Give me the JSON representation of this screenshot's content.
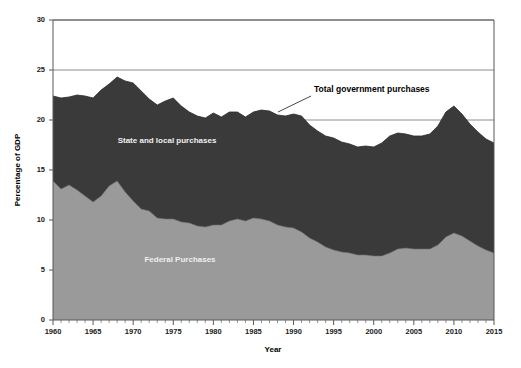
{
  "chart_data": {
    "type": "area",
    "stacked": true,
    "title": "",
    "xlabel": "Year",
    "ylabel": "Percentage of GDP",
    "xlim": [
      1960,
      2015
    ],
    "ylim": [
      0,
      30
    ],
    "ytick_values": [
      0,
      5,
      10,
      15,
      20,
      25,
      30
    ],
    "ytick_labels": [
      "0",
      "5",
      "10",
      "15",
      "20",
      "25",
      "30"
    ],
    "xtick_values": [
      1960,
      1965,
      1970,
      1975,
      1980,
      1985,
      1990,
      1995,
      2000,
      2005,
      2010,
      2015
    ],
    "xtick_labels": [
      "1960",
      "1965",
      "1970",
      "1975",
      "1980",
      "1985",
      "1990",
      "1995",
      "2000",
      "2005",
      "2010",
      "2015"
    ],
    "minor_xticks_per_interval": 5,
    "grid": "horizontal-only",
    "legend_position": "inline-annotations",
    "x": [
      1960,
      1961,
      1962,
      1963,
      1964,
      1965,
      1966,
      1967,
      1968,
      1969,
      1970,
      1971,
      1972,
      1973,
      1974,
      1975,
      1976,
      1977,
      1978,
      1979,
      1980,
      1981,
      1982,
      1983,
      1984,
      1985,
      1986,
      1987,
      1988,
      1989,
      1990,
      1991,
      1992,
      1993,
      1994,
      1995,
      1996,
      1997,
      1998,
      1999,
      2000,
      2001,
      2002,
      2003,
      2004,
      2005,
      2006,
      2007,
      2008,
      2009,
      2010,
      2011,
      2012,
      2013,
      2014,
      2015
    ],
    "series": [
      {
        "name": "Federal Purchases",
        "color": "#9a9a9a",
        "label_color": "#efefef",
        "values": [
          13.9,
          13.1,
          13.5,
          13.0,
          12.4,
          11.8,
          12.4,
          13.4,
          13.9,
          12.8,
          11.9,
          11.1,
          10.9,
          10.2,
          10.1,
          10.1,
          9.8,
          9.7,
          9.4,
          9.3,
          9.5,
          9.5,
          9.9,
          10.1,
          9.9,
          10.2,
          10.1,
          9.9,
          9.5,
          9.3,
          9.2,
          8.8,
          8.2,
          7.8,
          7.3,
          7.0,
          6.8,
          6.7,
          6.5,
          6.5,
          6.4,
          6.4,
          6.7,
          7.1,
          7.2,
          7.1,
          7.1,
          7.1,
          7.5,
          8.3,
          8.7,
          8.4,
          7.9,
          7.4,
          7.0,
          6.7
        ]
      },
      {
        "name": "State and local purchases",
        "color": "#3a3a3a",
        "label_color": "#efefef",
        "values": [
          8.5,
          9.1,
          8.8,
          9.5,
          10.0,
          10.4,
          10.6,
          10.2,
          10.4,
          11.1,
          11.8,
          11.8,
          11.2,
          11.3,
          11.8,
          12.1,
          11.6,
          11.1,
          11.0,
          10.9,
          11.2,
          10.8,
          10.9,
          10.7,
          10.4,
          10.6,
          10.9,
          11.0,
          11.0,
          11.1,
          11.4,
          11.6,
          11.3,
          11.1,
          11.1,
          11.2,
          11.0,
          10.9,
          10.8,
          10.9,
          10.9,
          11.3,
          11.7,
          11.6,
          11.4,
          11.3,
          11.3,
          11.5,
          11.9,
          12.5,
          12.7,
          12.2,
          11.7,
          11.4,
          11.1,
          11.0
        ]
      }
    ],
    "total_series": {
      "name": "Total government purchases",
      "values": [
        22.4,
        22.2,
        22.3,
        22.5,
        22.4,
        22.2,
        23.0,
        23.6,
        24.3,
        23.9,
        23.7,
        22.9,
        22.1,
        21.5,
        21.9,
        22.2,
        21.4,
        20.8,
        20.4,
        20.2,
        20.7,
        20.3,
        20.8,
        20.8,
        20.3,
        20.8,
        21.0,
        20.9,
        20.5,
        20.4,
        20.6,
        20.4,
        19.5,
        18.9,
        18.4,
        18.2,
        17.8,
        17.6,
        17.3,
        17.4,
        17.3,
        17.7,
        18.4,
        18.7,
        18.6,
        18.4,
        18.4,
        18.6,
        19.4,
        20.8,
        21.4,
        20.6,
        19.6,
        18.8,
        18.1,
        17.7
      ]
    },
    "annotations": [
      {
        "name": "total-government-purchases",
        "text": "Total government purchases",
        "x_px": 314,
        "y_px": 92,
        "leader_from": [
          311,
          96
        ],
        "leader_to": [
          278,
          112
        ]
      },
      {
        "name": "state-and-local-purchases",
        "text": "State and local purchases",
        "x_px": 167,
        "y_px": 143
      },
      {
        "name": "federal-purchases",
        "text": "Federal Purchases",
        "x_px": 180,
        "y_px": 262
      }
    ]
  },
  "axes": {
    "x_title": "Year",
    "y_title": "Percentage of GDP"
  },
  "colors": {
    "federal": "#9a9a9a",
    "state_local": "#3a3a3a",
    "grid": "#808080",
    "axis": "#595959",
    "background": "#ffffff",
    "text": "#000000"
  }
}
